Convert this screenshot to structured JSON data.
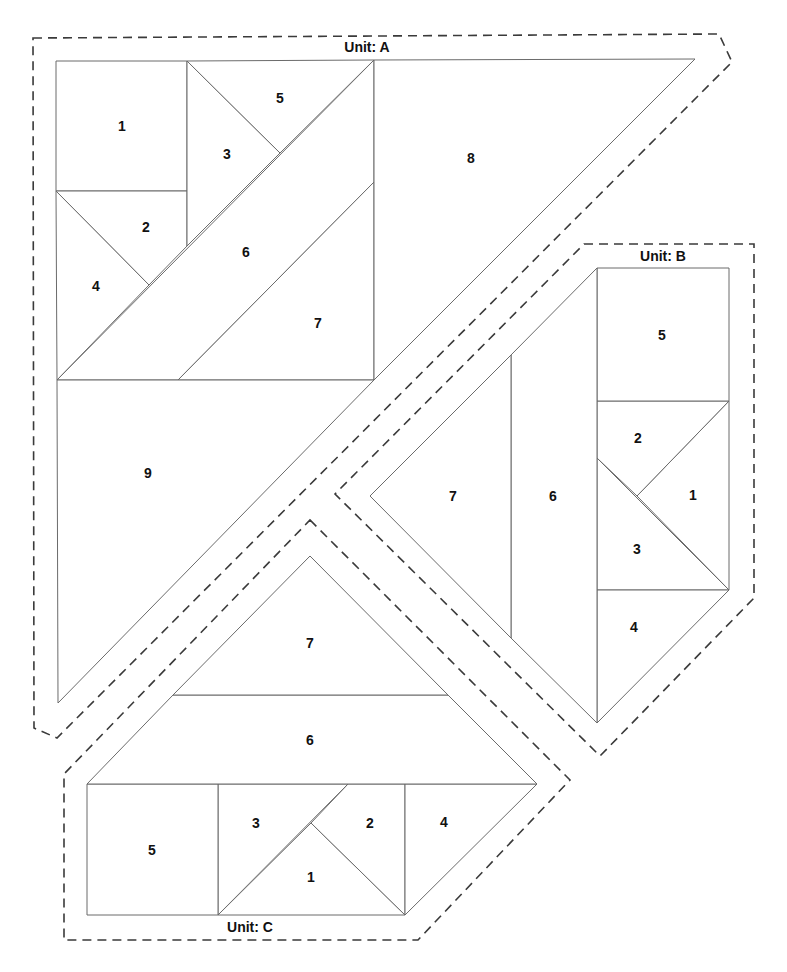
{
  "colors": {
    "background": "#ffffff",
    "piece_line": "#6b6b6b",
    "seam_line": "#3a3a3a",
    "text": "#111111"
  },
  "units": [
    {
      "id": "A",
      "label": "Unit: A",
      "label_pos": [
        367,
        47
      ],
      "seam_allowance_points": "33,38 719,34 732,62 57,738 34,728",
      "pieces": [
        {
          "number": "1",
          "points": "56,61 187,61 187,191 56,191",
          "label_pos": [
            122,
            126
          ]
        },
        {
          "number": "2",
          "points": "56,191 187,191 187,246 149,285",
          "label_pos": [
            146,
            227
          ]
        },
        {
          "number": "3",
          "points": "187,61 280,153 187,246",
          "label_pos": [
            227,
            154
          ]
        },
        {
          "number": "4",
          "points": "56,191 149,285 57,380",
          "label_pos": [
            96,
            286
          ]
        },
        {
          "number": "5",
          "points": "187,61 374,60 280,153",
          "label_pos": [
            280,
            98
          ]
        },
        {
          "number": "6",
          "points": "374,60 374,182 178,380 57,380",
          "label_pos": [
            246,
            252
          ]
        },
        {
          "number": "7",
          "points": "374,182 374,380 178,380",
          "label_pos": [
            318,
            323
          ]
        },
        {
          "number": "8",
          "points": "374,60 695,59 374,380",
          "label_pos": [
            471,
            158
          ]
        },
        {
          "number": "9",
          "points": "57,380 374,380 58,703",
          "label_pos": [
            148,
            473
          ]
        }
      ]
    },
    {
      "id": "B",
      "label": "Unit: B",
      "label_pos": [
        663,
        256
      ],
      "seam_allowance_points": "584,244 754,244 754,598 600,756 335,494",
      "pieces": [
        {
          "number": "1",
          "points": "729,401 729,590 637,496",
          "label_pos": [
            693,
            495
          ]
        },
        {
          "number": "2",
          "points": "597,401 729,401 637,496 597,458",
          "label_pos": [
            638,
            438
          ]
        },
        {
          "number": "3",
          "points": "597,458 729,590 597,590",
          "label_pos": [
            637,
            549
          ]
        },
        {
          "number": "4",
          "points": "597,590 729,590 597,723",
          "label_pos": [
            634,
            627
          ]
        },
        {
          "number": "5",
          "points": "597,268 729,268 729,401 597,401",
          "label_pos": [
            662,
            335
          ]
        },
        {
          "number": "6",
          "points": "597,268 597,723 511,638 511,355",
          "label_pos": [
            553,
            496
          ]
        },
        {
          "number": "7",
          "points": "511,355 511,638 370,496",
          "label_pos": [
            453,
            496
          ]
        }
      ]
    },
    {
      "id": "C",
      "label": "Unit: C",
      "label_pos": [
        250,
        927
      ],
      "seam_allowance_points": "310,520 570,780 418,940 64,940 64,774",
      "pieces": [
        {
          "number": "1",
          "points": "311,823 405,915 218,915",
          "label_pos": [
            311,
            877
          ]
        },
        {
          "number": "2",
          "points": "348,784 405,784 405,915 311,823",
          "label_pos": [
            370,
            823
          ]
        },
        {
          "number": "3",
          "points": "218,784 348,784 218,915",
          "label_pos": [
            256,
            823
          ]
        },
        {
          "number": "4",
          "points": "405,784 537,784 405,915",
          "label_pos": [
            444,
            822
          ]
        },
        {
          "number": "5",
          "points": "87,784 218,784 218,915 87,915",
          "label_pos": [
            152,
            850
          ]
        },
        {
          "number": "6",
          "points": "173,695 448,695 537,784 87,784",
          "label_pos": [
            310,
            740
          ]
        },
        {
          "number": "7",
          "points": "310,556 448,695 173,695",
          "label_pos": [
            310,
            643
          ]
        }
      ]
    }
  ]
}
